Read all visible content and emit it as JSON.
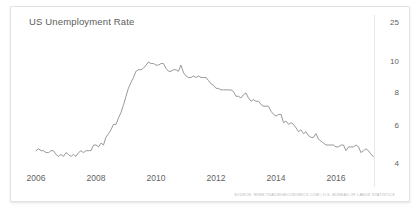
{
  "chart_data": {
    "type": "line",
    "title": "US Unemployment Rate",
    "xlabel": "",
    "ylabel": "",
    "ylim": [
      3.6,
      25
    ],
    "xlim": [
      2006.0,
      2017.4
    ],
    "grid": false,
    "legend_position": "none",
    "y_ticks": [
      "25",
      "10",
      "8",
      "6",
      "4"
    ],
    "y_tick_values": [
      25,
      10,
      8,
      6,
      4
    ],
    "x_ticks": [
      "2006",
      "2008",
      "2010",
      "2012",
      "2014",
      "2016"
    ],
    "x_tick_values": [
      2006,
      2008,
      2010,
      2012,
      2014,
      2016
    ],
    "line_color": "#8d8d8d",
    "series": [
      {
        "name": "US Unemployment Rate",
        "units": "percent",
        "x": [
          2006.0,
          2006.08,
          2006.17,
          2006.25,
          2006.33,
          2006.42,
          2006.5,
          2006.58,
          2006.67,
          2006.75,
          2006.83,
          2006.92,
          2007.0,
          2007.08,
          2007.17,
          2007.25,
          2007.33,
          2007.42,
          2007.5,
          2007.58,
          2007.67,
          2007.75,
          2007.83,
          2007.92,
          2008.0,
          2008.08,
          2008.17,
          2008.25,
          2008.33,
          2008.42,
          2008.5,
          2008.58,
          2008.67,
          2008.75,
          2008.83,
          2008.92,
          2009.0,
          2009.08,
          2009.17,
          2009.25,
          2009.33,
          2009.42,
          2009.5,
          2009.58,
          2009.67,
          2009.75,
          2009.83,
          2009.92,
          2010.0,
          2010.08,
          2010.17,
          2010.25,
          2010.33,
          2010.42,
          2010.5,
          2010.58,
          2010.67,
          2010.75,
          2010.83,
          2010.92,
          2011.0,
          2011.08,
          2011.17,
          2011.25,
          2011.33,
          2011.42,
          2011.5,
          2011.58,
          2011.67,
          2011.75,
          2011.83,
          2011.92,
          2012.0,
          2012.08,
          2012.17,
          2012.25,
          2012.33,
          2012.42,
          2012.5,
          2012.58,
          2012.67,
          2012.75,
          2012.83,
          2012.92,
          2013.0,
          2013.08,
          2013.17,
          2013.25,
          2013.33,
          2013.42,
          2013.5,
          2013.58,
          2013.67,
          2013.75,
          2013.83,
          2013.92,
          2014.0,
          2014.08,
          2014.17,
          2014.25,
          2014.33,
          2014.42,
          2014.5,
          2014.58,
          2014.67,
          2014.75,
          2014.83,
          2014.92,
          2015.0,
          2015.08,
          2015.17,
          2015.25,
          2015.33,
          2015.42,
          2015.5,
          2015.58,
          2015.67,
          2015.75,
          2015.83,
          2015.92,
          2016.0,
          2016.08,
          2016.17,
          2016.25,
          2016.33,
          2016.42,
          2016.5,
          2016.58,
          2016.67,
          2016.75,
          2016.83,
          2016.92,
          2017.0,
          2017.08,
          2017.17,
          2017.25
        ],
        "values": [
          4.7,
          4.8,
          4.7,
          4.7,
          4.6,
          4.6,
          4.7,
          4.7,
          4.5,
          4.4,
          4.5,
          4.4,
          4.6,
          4.5,
          4.4,
          4.5,
          4.4,
          4.6,
          4.7,
          4.6,
          4.7,
          4.7,
          4.7,
          5.0,
          5.0,
          4.9,
          5.1,
          5.0,
          5.4,
          5.6,
          5.8,
          6.1,
          6.1,
          6.5,
          6.8,
          7.3,
          7.8,
          8.3,
          8.7,
          9.0,
          9.4,
          9.5,
          9.5,
          9.6,
          9.8,
          10.0,
          9.9,
          9.9,
          9.8,
          9.8,
          9.9,
          9.9,
          9.6,
          9.4,
          9.4,
          9.5,
          9.5,
          9.4,
          9.8,
          9.3,
          9.1,
          9.0,
          9.0,
          9.1,
          9.0,
          9.1,
          9.0,
          9.0,
          9.0,
          8.8,
          8.6,
          8.5,
          8.3,
          8.3,
          8.2,
          8.2,
          8.2,
          8.2,
          8.2,
          8.1,
          7.8,
          7.8,
          7.7,
          7.9,
          8.0,
          7.7,
          7.5,
          7.6,
          7.5,
          7.5,
          7.3,
          7.2,
          7.2,
          7.2,
          6.9,
          6.7,
          6.6,
          6.7,
          6.7,
          6.2,
          6.3,
          6.1,
          6.2,
          6.1,
          5.9,
          5.7,
          5.8,
          5.6,
          5.7,
          5.5,
          5.4,
          5.4,
          5.6,
          5.3,
          5.2,
          5.1,
          5.0,
          5.0,
          5.0,
          5.0,
          4.9,
          4.9,
          5.0,
          5.0,
          4.7,
          4.9,
          4.9,
          4.9,
          5.0,
          4.9,
          4.6,
          4.7,
          4.8,
          4.7,
          4.5,
          4.4
        ]
      }
    ],
    "annotations": {
      "source": "SOURCE: WWW.TRADINGECONOMICS.COM | U.S. BUREAU OF LABOR STATISTICS"
    }
  },
  "widget": {
    "title": "US Unemployment Rate",
    "source_text": "SOURCE: WWW.TRADINGECONOMICS.COM | U.S. BUREAU OF LABOR STATISTICS"
  }
}
